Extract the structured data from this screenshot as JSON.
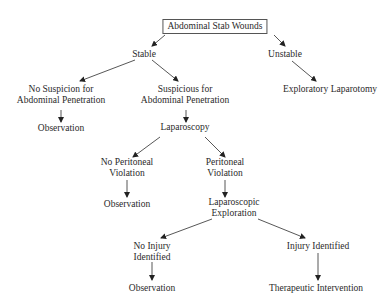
{
  "diagram": {
    "type": "flowchart",
    "nodes": {
      "root": {
        "lines": [
          "Abdominal Stab Wounds"
        ]
      },
      "stable": {
        "lines": [
          "Stable"
        ]
      },
      "unstable": {
        "lines": [
          "Unstable"
        ]
      },
      "no_suspicion": {
        "lines": [
          "No Suspicion for",
          "Abdominal Penetration"
        ]
      },
      "suspicious": {
        "lines": [
          "Suspicious for",
          "Abdominal Penetration"
        ]
      },
      "exploratory_laparotomy": {
        "lines": [
          "Exploratory Laparotomy"
        ]
      },
      "observation_1": {
        "lines": [
          "Observation"
        ]
      },
      "laparoscopy": {
        "lines": [
          "Laparoscopy"
        ]
      },
      "no_peritoneal_violation": {
        "lines": [
          "No Peritoneal",
          "Violation"
        ]
      },
      "peritoneal_violation": {
        "lines": [
          "Peritoneal",
          "Violation"
        ]
      },
      "observation_2": {
        "lines": [
          "Observation"
        ]
      },
      "laparoscopic_exploration": {
        "lines": [
          "Laparoscopic",
          "Exploration"
        ]
      },
      "no_injury": {
        "lines": [
          "No Injury",
          "Identified"
        ]
      },
      "injury_identified": {
        "lines": [
          "Injury Identified"
        ]
      },
      "observation_3": {
        "lines": [
          "Observation"
        ]
      },
      "therapeutic_intervention": {
        "lines": [
          "Therapeutic Intervention"
        ]
      }
    },
    "edges": [
      [
        "root",
        "stable"
      ],
      [
        "root",
        "unstable"
      ],
      [
        "stable",
        "no_suspicion"
      ],
      [
        "stable",
        "suspicious"
      ],
      [
        "unstable",
        "exploratory_laparotomy"
      ],
      [
        "no_suspicion",
        "observation_1"
      ],
      [
        "suspicious",
        "laparoscopy"
      ],
      [
        "laparoscopy",
        "no_peritoneal_violation"
      ],
      [
        "laparoscopy",
        "peritoneal_violation"
      ],
      [
        "no_peritoneal_violation",
        "observation_2"
      ],
      [
        "peritoneal_violation",
        "laparoscopic_exploration"
      ],
      [
        "laparoscopic_exploration",
        "no_injury"
      ],
      [
        "laparoscopic_exploration",
        "injury_identified"
      ],
      [
        "no_injury",
        "observation_3"
      ],
      [
        "injury_identified",
        "therapeutic_intervention"
      ]
    ]
  }
}
